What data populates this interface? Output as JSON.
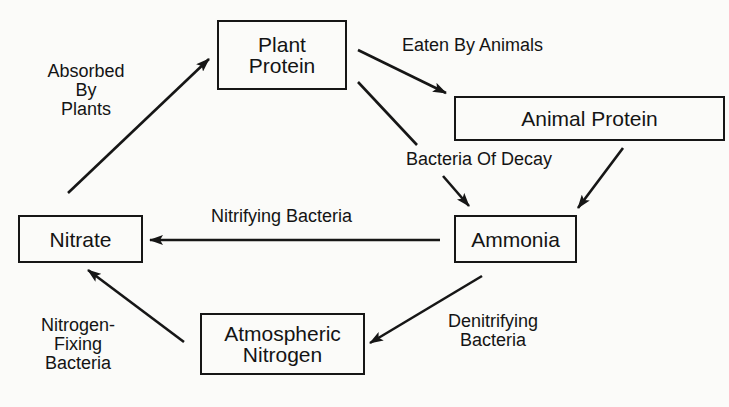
{
  "diagram": {
    "type": "cycle",
    "nodes": {
      "plant_protein": {
        "line1": "Plant",
        "line2": "Protein"
      },
      "animal_protein": {
        "label": "Animal Protein"
      },
      "ammonia": {
        "label": "Ammonia"
      },
      "nitrate": {
        "label": "Nitrate"
      },
      "atmospheric_nitrogen": {
        "line1": "Atmospheric",
        "line2": "Nitrogen"
      }
    },
    "edges": {
      "eaten_by_animals": {
        "from": "Plant Protein",
        "to": "Animal Protein",
        "label": "Eaten By Animals"
      },
      "bacteria_of_decay": {
        "from": "Plant Protein",
        "to": "Ammonia",
        "label": "Bacteria Of Decay"
      },
      "animal_to_ammonia": {
        "from": "Animal Protein",
        "to": "Ammonia",
        "label": ""
      },
      "nitrifying_bacteria": {
        "from": "Ammonia",
        "to": "Nitrate",
        "label": "Nitrifying Bacteria"
      },
      "absorbed_by_plants": {
        "from": "Nitrate",
        "to": "Plant Protein",
        "line1": "Absorbed",
        "line2": "By",
        "line3": "Plants"
      },
      "denitrifying_bacteria": {
        "from": "Ammonia",
        "to": "Atmospheric Nitrogen",
        "line1": "Denitrifying",
        "line2": "Bacteria"
      },
      "nitrogen_fixing_bacteria": {
        "from": "Atmospheric Nitrogen",
        "to": "Nitrate",
        "line1": "Nitrogen-",
        "line2": "Fixing",
        "line3": "Bacteria"
      }
    }
  }
}
